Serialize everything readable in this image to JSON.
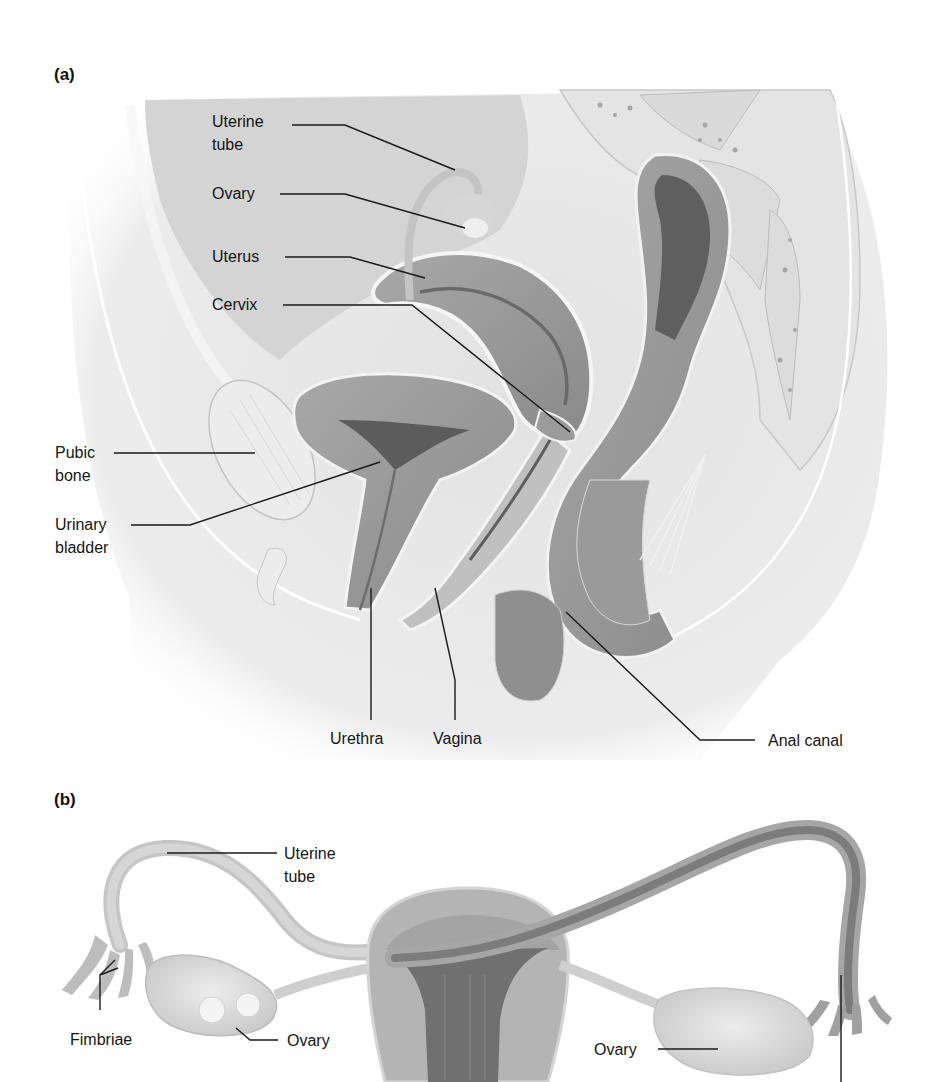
{
  "figure": {
    "panel_a": {
      "letter": "(a)",
      "labels": [
        {
          "id": "uterine-tube",
          "text": "Uterine\ntube"
        },
        {
          "id": "ovary",
          "text": "Ovary"
        },
        {
          "id": "uterus",
          "text": "Uterus"
        },
        {
          "id": "cervix",
          "text": "Cervix"
        },
        {
          "id": "pubic-bone",
          "text": "Pubic\nbone"
        },
        {
          "id": "urinary-bladder",
          "text": "Urinary\nbladder"
        },
        {
          "id": "urethra",
          "text": "Urethra"
        },
        {
          "id": "vagina",
          "text": "Vagina"
        },
        {
          "id": "anal-canal",
          "text": "Anal canal"
        }
      ]
    },
    "panel_b": {
      "letter": "(b)",
      "labels": [
        {
          "id": "uterine-tube",
          "text": "Uterine\ntube"
        },
        {
          "id": "fimbriae",
          "text": "Fimbriae"
        },
        {
          "id": "ovary-left",
          "text": "Ovary"
        },
        {
          "id": "ovary-right",
          "text": "Ovary"
        }
      ]
    },
    "colors": {
      "tissue_light": "#e9e9e9",
      "tissue_mid": "#bdbdbd",
      "tissue_dark": "#8e8e8e",
      "organ_wall": "#9f9f9f",
      "lumen_dark": "#6e6e6e",
      "leader_line": "#1a1a1a"
    }
  }
}
